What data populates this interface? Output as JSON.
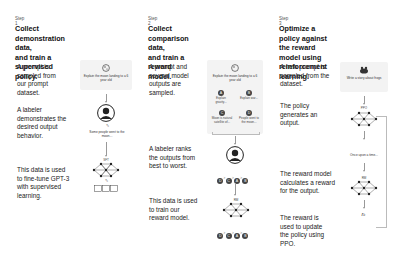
{
  "steps": [
    {
      "step_label": "Step 1",
      "title_line1": "Collect demonstration data,",
      "title_line2": "and train a supervised policy.",
      "descriptions": [
        "A prompt is sampled from our prompt dataset.",
        "A labeler demonstrates the desired output behavior.",
        "This data is used to fine-tune GPT-3 with supervised learning."
      ],
      "prompt_text": "Explain the moon landing to a 6 year old",
      "demo_text": "Some people went to the moon...",
      "model_label": "SFT"
    },
    {
      "step_label": "Step 2",
      "title_line1": "Collect comparison data,",
      "title_line2": "and train a reward model.",
      "descriptions": [
        "A prompt and several model outputs are sampled.",
        "A labeler ranks the outputs from best to worst.",
        "This data is used to train our reward model."
      ],
      "prompt_text": "Explain the moon landing to a 6 year old",
      "outputs": [
        {
          "id": "A",
          "text": "Explain gravity..."
        },
        {
          "id": "B",
          "text": "Explain war..."
        },
        {
          "id": "C",
          "text": "Moon is natural satellite of..."
        },
        {
          "id": "D",
          "text": "People went to the moon..."
        }
      ],
      "ranking": [
        "D",
        "C",
        "A",
        "B"
      ],
      "ranking_sep": ">",
      "model_label": "RM"
    },
    {
      "step_label": "Step 3",
      "title_line1": "Optimize a policy against",
      "title_line2": "the reward model using",
      "title_line3": "reinforcement learning.",
      "descriptions": [
        "A new prompt is sampled from the dataset.",
        "The policy generates an output.",
        "The reward model calculates a reward for the output.",
        "The reward is used to update the policy using PPO."
      ],
      "prompt_text": "Write a story about frogs",
      "policy_label": "PPO",
      "output_text": "Once upon a time...",
      "model_label": "RM",
      "reward_symbol": "rₖ"
    }
  ]
}
